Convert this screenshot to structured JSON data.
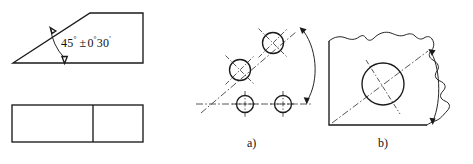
{
  "figure": {
    "title_text": "",
    "background_color": "#ffffff",
    "line_color": "#1a1a1a",
    "center_line_color": "#2b2b2b"
  },
  "left_view": {
    "name": "chamfer-part-views",
    "top_shape": "trapezoid-with-45-degree-chamfer",
    "bottom_shape": "rectangle-with-vertical-divider",
    "angle_dimension": {
      "nominal_value": "45",
      "nominal_unit": "°",
      "tolerance_sign": "±",
      "tolerance_degrees": "0",
      "tolerance_degrees_unit": "°",
      "tolerance_minutes": "30",
      "tolerance_minutes_unit": "′",
      "full_text": "45° ±0°30′"
    }
  },
  "diagram_a": {
    "caption": "a)",
    "description": "angled-hole-pattern-with-angular-dimension-arc",
    "hole_count": 4,
    "inclined_holes": 2,
    "baseline_holes": 2
  },
  "diagram_b": {
    "caption": "b)",
    "description": "broken-out-part-with-single-hole-on-inclined-axis",
    "hole_count": 1
  }
}
